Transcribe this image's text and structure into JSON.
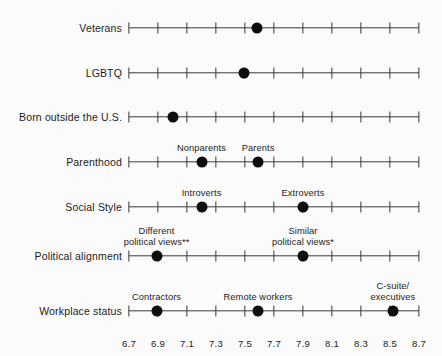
{
  "chart_data": {
    "type": "scatter",
    "title": "",
    "subtitle": "",
    "xlabel": "",
    "ylabel": "",
    "xlim": [
      6.7,
      8.7
    ],
    "xticks": [
      6.7,
      6.9,
      7.1,
      7.3,
      7.5,
      7.7,
      7.9,
      8.1,
      8.3,
      8.5,
      8.7
    ],
    "xtick_labels": [
      "6.7",
      "6.9",
      "7.1",
      "7.3",
      "7.5",
      "7.7",
      "7.9",
      "8.1",
      "8.3",
      "8.5",
      "8.7"
    ],
    "grid": false,
    "legend": "none",
    "categories": [
      "Veterans",
      "LGBTQ",
      "Born outside the U.S.",
      "Parenthood",
      "Social Style",
      "Political alignment",
      "Workplace status"
    ],
    "rows": [
      {
        "label": "Veterans",
        "y": 28,
        "points": [
          {
            "value": 7.58,
            "label": ""
          }
        ]
      },
      {
        "label": "LGBTQ",
        "y": 73,
        "points": [
          {
            "value": 7.49,
            "label": ""
          }
        ]
      },
      {
        "label": "Born outside the U.S.",
        "y": 117,
        "points": [
          {
            "value": 7.0,
            "label": ""
          }
        ]
      },
      {
        "label": "Parenthood",
        "y": 162,
        "points": [
          {
            "value": 7.2,
            "label": "Nonparents"
          },
          {
            "value": 7.59,
            "label": "Parents"
          }
        ]
      },
      {
        "label": "Social Style",
        "y": 207,
        "points": [
          {
            "value": 7.2,
            "label": "Introverts"
          },
          {
            "value": 7.9,
            "label": "Extroverts"
          }
        ]
      },
      {
        "label": "Political alignment",
        "y": 256,
        "points": [
          {
            "value": 6.89,
            "label": "Different\npolitical views**"
          },
          {
            "value": 7.9,
            "label": "Similar\npolitical views*"
          }
        ]
      },
      {
        "label": "Workplace status",
        "y": 311,
        "points": [
          {
            "value": 6.89,
            "label": "Contractors"
          },
          {
            "value": 7.59,
            "label": "Remote workers"
          },
          {
            "value": 8.52,
            "label": "C-suite/\nexecutives"
          }
        ]
      }
    ]
  },
  "axis": {
    "x_left_px": 129,
    "x_right_px": 419,
    "tick_label_y": 338
  },
  "colors": {
    "dot": "#0d0d0d",
    "axis": "#3a3a3a",
    "text": "#1b1b1b",
    "background": "#fbfbfb"
  }
}
